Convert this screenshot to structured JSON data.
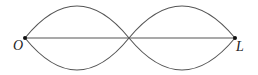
{
  "diagram": {
    "type": "standing-wave-two-loops",
    "points": [
      {
        "id": "O",
        "label": "O"
      },
      {
        "id": "L",
        "label": "L"
      }
    ],
    "colors": {
      "stroke": "#555555",
      "point": "#111111",
      "label": "#222222"
    }
  }
}
